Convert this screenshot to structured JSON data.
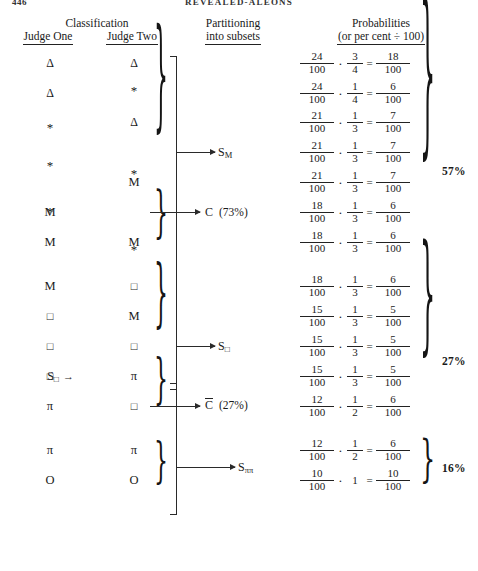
{
  "running_head": {
    "folio": "446",
    "title": "REVEALED-ALEONS"
  },
  "headers": {
    "classification": {
      "line1": "Classification"
    },
    "judge_one": "Judge One",
    "judge_two": "Judge Two",
    "partitioning": {
      "line1": "Partitioning",
      "line2": "into subsets"
    },
    "probabilities": {
      "line1": "Probabilities",
      "line2": "(or per cent ÷ 100)"
    }
  },
  "symbols": {
    "triangle": "Δ",
    "star": "*",
    "m": "M",
    "square": "□",
    "pi": "π",
    "o": "O"
  },
  "rows": [
    {
      "judge_one": "Δ",
      "judge_two": "Δ"
    },
    {
      "judge_one": "Δ",
      "judge_two": "*"
    },
    {
      "judge_one": "*",
      "judge_two": "Δ"
    },
    {
      "judge_one": "*",
      "judge_two": "*"
    },
    {
      "judge_one": "*",
      "judge_two": "M"
    },
    {
      "judge_one": "M",
      "judge_two": "*"
    },
    {
      "judge_one": "M",
      "judge_two": "M"
    },
    {
      "judge_one": "M",
      "judge_two": "□"
    },
    {
      "judge_one": "□",
      "judge_two": "M"
    },
    {
      "judge_one": "□",
      "judge_two": "□"
    },
    {
      "judge_one": "□",
      "judge_two": "π"
    },
    {
      "judge_one": "π",
      "judge_two": "□"
    },
    {
      "judge_one": "π",
      "judge_two": "π"
    },
    {
      "judge_one": "O",
      "judge_two": "O"
    }
  ],
  "row_pointer": {
    "label_base": "S",
    "label_sub": "□",
    "arrow": "→",
    "row_index": 10
  },
  "partition_labels": [
    {
      "base": "S",
      "sub": "M",
      "pct": "",
      "overline": false
    },
    {
      "base": "C",
      "sub": "",
      "pct": "(73%)",
      "overline": false
    },
    {
      "base": "S",
      "sub": "□",
      "pct": "",
      "overline": false
    },
    {
      "base": "C",
      "sub": "",
      "pct": "(27%)",
      "overline": true
    },
    {
      "base": "S",
      "sub": "ππ",
      "pct": "",
      "overline": false
    }
  ],
  "probabilities": [
    {
      "p1_num": "24",
      "p1_den": "100",
      "dot": "·",
      "p2_num": "3",
      "p2_den": "4",
      "eq": "=",
      "r_num": "18",
      "r_den": "100"
    },
    {
      "p1_num": "24",
      "p1_den": "100",
      "dot": "·",
      "p2_num": "1",
      "p2_den": "4",
      "eq": "=",
      "r_num": "6",
      "r_den": "100"
    },
    {
      "p1_num": "21",
      "p1_den": "100",
      "dot": "·",
      "p2_num": "1",
      "p2_den": "3",
      "eq": "=",
      "r_num": "7",
      "r_den": "100"
    },
    {
      "p1_num": "21",
      "p1_den": "100",
      "dot": "·",
      "p2_num": "1",
      "p2_den": "3",
      "eq": "=",
      "r_num": "7",
      "r_den": "100"
    },
    {
      "p1_num": "21",
      "p1_den": "100",
      "dot": "·",
      "p2_num": "1",
      "p2_den": "3",
      "eq": "=",
      "r_num": "7",
      "r_den": "100"
    },
    {
      "p1_num": "18",
      "p1_den": "100",
      "dot": "·",
      "p2_num": "1",
      "p2_den": "3",
      "eq": "=",
      "r_num": "6",
      "r_den": "100"
    },
    {
      "p1_num": "18",
      "p1_den": "100",
      "dot": "·",
      "p2_num": "1",
      "p2_den": "3",
      "eq": "=",
      "r_num": "6",
      "r_den": "100"
    },
    {
      "p1_num": "18",
      "p1_den": "100",
      "dot": "·",
      "p2_num": "1",
      "p2_den": "3",
      "eq": "=",
      "r_num": "6",
      "r_den": "100"
    },
    {
      "p1_num": "15",
      "p1_den": "100",
      "dot": "·",
      "p2_num": "1",
      "p2_den": "3",
      "eq": "=",
      "r_num": "5",
      "r_den": "100"
    },
    {
      "p1_num": "15",
      "p1_den": "100",
      "dot": "·",
      "p2_num": "1",
      "p2_den": "3",
      "eq": "=",
      "r_num": "5",
      "r_den": "100"
    },
    {
      "p1_num": "15",
      "p1_den": "100",
      "dot": "·",
      "p2_num": "1",
      "p2_den": "3",
      "eq": "=",
      "r_num": "5",
      "r_den": "100"
    },
    {
      "p1_num": "12",
      "p1_den": "100",
      "dot": "·",
      "p2_num": "1",
      "p2_den": "2",
      "eq": "=",
      "r_num": "6",
      "r_den": "100"
    },
    {
      "p1_num": "12",
      "p1_den": "100",
      "dot": "·",
      "p2_num": "1",
      "p2_den": "2",
      "eq": "=",
      "r_num": "6",
      "r_den": "100"
    },
    {
      "p1_num": "10",
      "p1_den": "100",
      "dot": "·",
      "p2_num": "1",
      "p2_den": "",
      "eq": "=",
      "r_num": "10",
      "r_den": "100"
    }
  ],
  "group_percentages": [
    {
      "value": "57%"
    },
    {
      "value": "27%"
    },
    {
      "value": "16%"
    }
  ],
  "colors": {
    "ink": "#1a1a1a",
    "rule": "#222222",
    "paper": "#ffffff"
  }
}
